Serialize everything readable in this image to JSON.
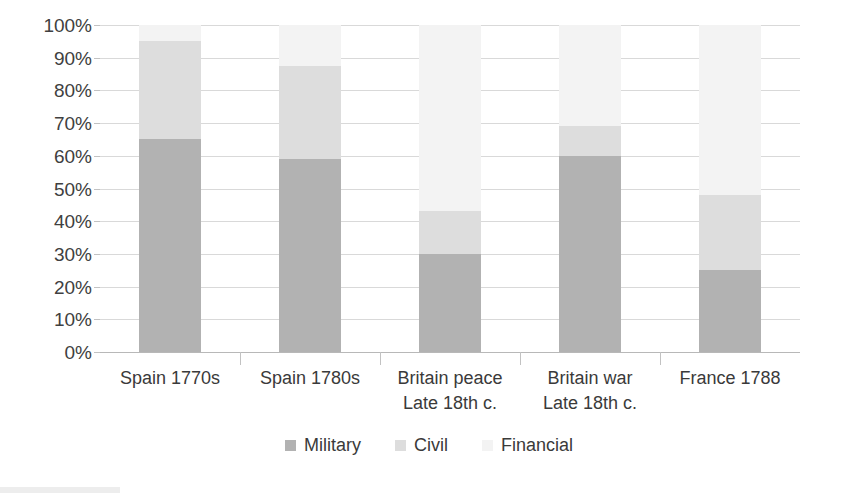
{
  "chart_data": {
    "type": "bar",
    "subtype": "stacked-100-percent",
    "title": "",
    "xlabel": "",
    "ylabel": "",
    "ylim": [
      0,
      100
    ],
    "grid": true,
    "legend_position": "bottom",
    "categories": [
      "Spain 1770s",
      "Spain 1780s",
      "Britain peace Late 18th c.",
      "Britain war Late 18th c.",
      "France 1788"
    ],
    "category_lines": [
      [
        "Spain 1770s",
        ""
      ],
      [
        "Spain 1780s",
        ""
      ],
      [
        "Britain peace",
        "Late 18th c."
      ],
      [
        "Britain war",
        "Late 18th c."
      ],
      [
        "France 1788",
        ""
      ]
    ],
    "series": [
      {
        "name": "Military",
        "color": "#b2b2b2",
        "values": [
          65,
          59,
          30,
          60,
          25
        ]
      },
      {
        "name": "Civil",
        "color": "#dddddd",
        "values": [
          30,
          28.5,
          13,
          9,
          23
        ]
      },
      {
        "name": "Financial",
        "color": "#f3f3f3",
        "values": [
          5,
          12.5,
          57,
          31,
          52
        ]
      }
    ],
    "y_ticks": [
      {
        "value": 100,
        "label": "100%"
      },
      {
        "value": 90,
        "label": "90%"
      },
      {
        "value": 80,
        "label": "80%"
      },
      {
        "value": 70,
        "label": "70%"
      },
      {
        "value": 60,
        "label": "60%"
      },
      {
        "value": 50,
        "label": "50%"
      },
      {
        "value": 40,
        "label": "40%"
      },
      {
        "value": 30,
        "label": "30%"
      },
      {
        "value": 20,
        "label": "20%"
      },
      {
        "value": 10,
        "label": "10%"
      },
      {
        "value": 0,
        "label": "0%"
      }
    ]
  },
  "legend": {
    "items": [
      {
        "label": "Military",
        "color": "#b2b2b2"
      },
      {
        "label": "Civil",
        "color": "#dddddd"
      },
      {
        "label": "Financial",
        "color": "#f3f3f3"
      }
    ]
  }
}
